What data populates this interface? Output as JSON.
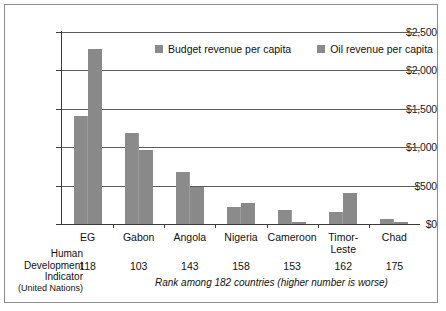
{
  "chart_data": {
    "type": "bar",
    "title": "",
    "xlabel": "Rank among 182 countries (higher number is worse)",
    "ylabel": "",
    "ylim": [
      0,
      2500
    ],
    "ytick_labels": [
      "$0",
      "$500",
      "$1,000",
      "$1,500",
      "$2,000",
      "$2,500"
    ],
    "ytick_values": [
      0,
      500,
      1000,
      1500,
      2000,
      2500
    ],
    "grid": true,
    "legend_position": "top-center",
    "categories": [
      "EG",
      "Gabon",
      "Angola",
      "Nigeria",
      "Cameroon",
      "Timor-Leste",
      "Chad"
    ],
    "series": [
      {
        "name": "Budget revenue per capita",
        "color": "#8b8b8b",
        "values": [
          1400,
          1190,
          680,
          220,
          180,
          150,
          70
        ]
      },
      {
        "name": "Oil revenue per capita",
        "color": "#898989",
        "values": [
          2280,
          960,
          480,
          280,
          25,
          410,
          20
        ]
      }
    ],
    "annotations": {
      "hdi_label_lines": [
        "Human",
        "Development",
        "Indicator",
        "(United Nations)"
      ],
      "hdi_ranks": [
        118,
        103,
        143,
        158,
        153,
        162,
        175
      ]
    }
  }
}
